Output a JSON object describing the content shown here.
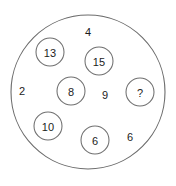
{
  "diagram": {
    "type": "set-membership-circle-puzzle",
    "canvas": {
      "width": 176,
      "height": 186,
      "background": "#ffffff"
    },
    "outer_circle": {
      "name": "set-boundary",
      "cx": 88,
      "cy": 92,
      "r": 77,
      "stroke": "#6b6b6b",
      "fill": "#ffffff"
    },
    "circled_numbers": [
      {
        "id": "node-13",
        "label": "13",
        "cx": 50,
        "cy": 52,
        "r": 14
      },
      {
        "id": "node-15",
        "label": "15",
        "cx": 99,
        "cy": 61,
        "r": 14
      },
      {
        "id": "node-8",
        "label": "8",
        "cx": 71,
        "cy": 91,
        "r": 14
      },
      {
        "id": "node-unknown",
        "label": "?",
        "cx": 140,
        "cy": 92,
        "r": 14
      },
      {
        "id": "node-10",
        "label": "10",
        "cx": 48,
        "cy": 126,
        "r": 14
      },
      {
        "id": "node-6",
        "label": "6",
        "cx": 95,
        "cy": 140,
        "r": 14
      }
    ],
    "free_numbers": [
      {
        "id": "free-4",
        "label": "4",
        "x": 88,
        "y": 32
      },
      {
        "id": "free-2",
        "label": "2",
        "x": 22,
        "y": 91
      },
      {
        "id": "free-9",
        "label": "9",
        "x": 105,
        "y": 95
      },
      {
        "id": "free-6",
        "label": "6",
        "x": 130,
        "y": 137
      }
    ]
  }
}
